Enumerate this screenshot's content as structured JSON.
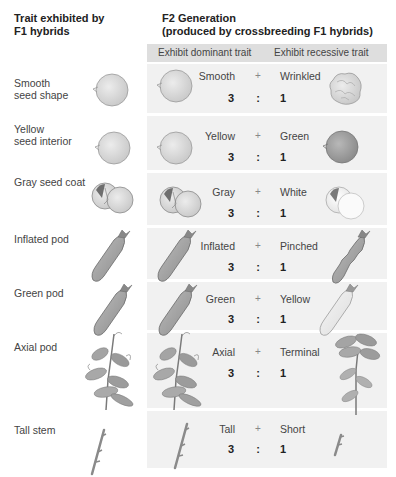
{
  "header": {
    "left_title": "Trait exhibited by F1 hybrids",
    "left_title_line1": "Trait exhibited by",
    "left_title_line2": "F1 hybrids",
    "right_title_line1": "F2 Generation",
    "right_title_line2": "(produced by crossbreeding F1 hybrids)"
  },
  "columns": {
    "dominant": "Exhibit dominant trait",
    "recessive": "Exhibit recessive trait"
  },
  "rows": [
    {
      "trait_line1": "Smooth",
      "trait_line2": "seed shape",
      "dominant": "Smooth",
      "recessive": "Wrinkled",
      "plus": "+",
      "dominant_count": "3",
      "colon": ":",
      "recessive_count": "1",
      "icon": "seed-round"
    },
    {
      "trait_line1": "Yellow",
      "trait_line2": "seed interior",
      "dominant": "Yellow",
      "recessive": "Green",
      "plus": "+",
      "dominant_count": "3",
      "colon": ":",
      "recessive_count": "1",
      "icon": "seed-round"
    },
    {
      "trait_line1": "Gray seed coat",
      "trait_line2": "",
      "dominant": "Gray",
      "recessive": "White",
      "plus": "+",
      "dominant_count": "3",
      "colon": ":",
      "recessive_count": "1",
      "icon": "seed-coat"
    },
    {
      "trait_line1": "Inflated pod",
      "trait_line2": "",
      "dominant": "Inflated",
      "recessive": "Pinched",
      "plus": "+",
      "dominant_count": "3",
      "colon": ":",
      "recessive_count": "1",
      "icon": "pod"
    },
    {
      "trait_line1": "Green pod",
      "trait_line2": "",
      "dominant": "Green",
      "recessive": "Yellow",
      "plus": "+",
      "dominant_count": "3",
      "colon": ":",
      "recessive_count": "1",
      "icon": "pod"
    },
    {
      "trait_line1": "Axial pod",
      "trait_line2": "",
      "dominant": "Axial",
      "recessive": "Terminal",
      "plus": "+",
      "dominant_count": "3",
      "colon": ":",
      "recessive_count": "1",
      "icon": "plant"
    },
    {
      "trait_line1": "Tall stem",
      "trait_line2": "",
      "dominant": "Tall",
      "recessive": "Short",
      "plus": "+",
      "dominant_count": "3",
      "colon": ":",
      "recessive_count": "1",
      "icon": "stem"
    }
  ],
  "ratio": "3 : 1"
}
